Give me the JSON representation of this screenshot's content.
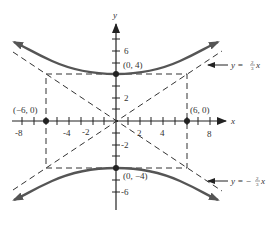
{
  "diagram": {
    "type": "hyperbola-graph",
    "equation_hint": "y^2/16 - x^2/36 = 1",
    "axes": {
      "x_label": "x",
      "y_label": "y",
      "x_ticks": [
        "-8",
        "-4",
        "-2",
        "2",
        "4",
        "8"
      ],
      "y_ticks": [
        "6",
        "2",
        "-2",
        "-6"
      ]
    },
    "points": [
      {
        "label": "(0, 4)",
        "x": 0,
        "y": 4
      },
      {
        "label": "(0, −4)",
        "x": 0,
        "y": -4
      },
      {
        "label": "(−6, 0)",
        "x": -6,
        "y": 0
      },
      {
        "label": "(6, 0)",
        "x": 6,
        "y": 0
      }
    ],
    "asymptotes": [
      {
        "label": "y = ⅔x",
        "prefix": "y = ",
        "num": "2",
        "den": "3",
        "suffix": "x"
      },
      {
        "label": "y = −⅔x",
        "prefix": "y = −",
        "num": "2",
        "den": "3",
        "suffix": "x"
      }
    ],
    "colors": {
      "curve": "#555555",
      "axis": "#222222",
      "dashed": "#333333",
      "background": "#ffffff"
    }
  }
}
